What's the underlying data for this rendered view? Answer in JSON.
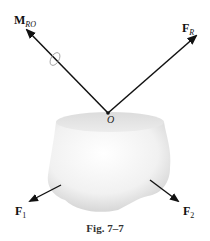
{
  "figure": {
    "caption": "Fig. 7–7",
    "origin_label": "O",
    "vectors": [
      {
        "id": "moment",
        "symbol": "M",
        "subscript": "RO"
      },
      {
        "id": "resultant",
        "symbol": "F",
        "subscript": "R"
      },
      {
        "id": "force1",
        "symbol": "F",
        "subscript": "1"
      },
      {
        "id": "force2",
        "symbol": "F",
        "subscript": "2"
      }
    ]
  }
}
